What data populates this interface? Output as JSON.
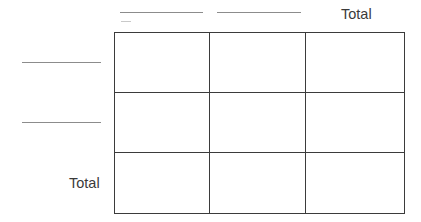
{
  "worksheet": {
    "type": "two-way-frequency-table",
    "background_color": "#ffffff",
    "grid_line_color": "#3b3b3b",
    "blank_rule_color": "#8c8c8c",
    "text_color": "#3a3a3a"
  },
  "column_headers": [
    {
      "kind": "blank-line",
      "label": ""
    },
    {
      "kind": "blank-line",
      "label": ""
    },
    {
      "kind": "text",
      "label": "Total"
    }
  ],
  "row_headers": [
    {
      "kind": "blank-line",
      "label": ""
    },
    {
      "kind": "blank-line",
      "label": ""
    },
    {
      "kind": "text",
      "label": "Total"
    }
  ],
  "cells": [
    [
      "",
      "",
      ""
    ],
    [
      "",
      "",
      ""
    ],
    [
      "",
      "",
      ""
    ]
  ]
}
